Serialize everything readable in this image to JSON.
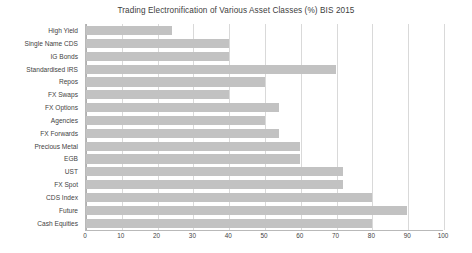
{
  "chart_data": {
    "type": "bar",
    "orientation": "horizontal",
    "title": "Trading Electronification of Various Asset Classes (%) BIS 2015",
    "xlabel": "",
    "ylabel": "",
    "xlim": [
      0,
      100
    ],
    "xticks": [
      "0",
      "10",
      "20",
      "30",
      "40",
      "50",
      "60",
      "70",
      "80",
      "90",
      "100"
    ],
    "xtick_values": [
      0,
      10,
      20,
      30,
      40,
      50,
      60,
      70,
      80,
      90,
      100
    ],
    "grid": true,
    "legend": false,
    "bar_color": "#c2c2c2",
    "grid_color": "#d9d9d9",
    "background": "#ffffff",
    "categories": [
      "High Yield",
      "Single Name CDS",
      "IG Bonds",
      "Standardised IRS",
      "Repos",
      "FX Swaps",
      "FX Options",
      "Agencies",
      "FX Forwards",
      "Precious Metal",
      "EGB",
      "UST",
      "FX Spot",
      "CDS Index",
      "Future",
      "Cash Equities"
    ],
    "values": [
      24,
      40,
      40,
      70,
      50,
      40,
      54,
      50,
      54,
      60,
      60,
      72,
      72,
      80,
      90,
      80
    ]
  }
}
